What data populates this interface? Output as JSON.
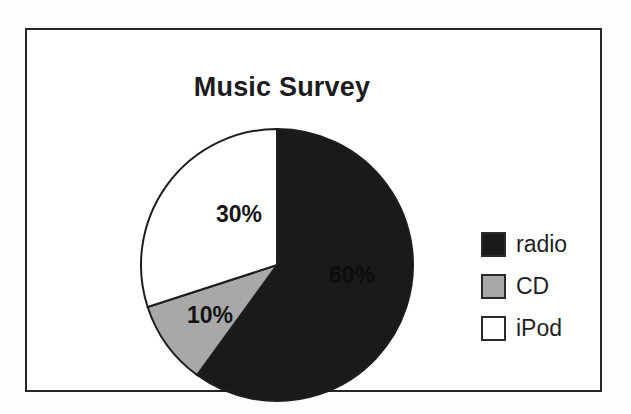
{
  "frame": {
    "border_color": "#262626",
    "background": "#ffffff"
  },
  "chart_data": {
    "type": "pie",
    "title": "Music Survey",
    "xlabel": "",
    "ylabel": "",
    "categories": [
      "radio",
      "CD",
      "iPod"
    ],
    "values": [
      60,
      10,
      30
    ],
    "value_unit": "%",
    "data_labels": [
      "60%",
      "10%",
      "30%"
    ],
    "colors": [
      "#1a1a1a",
      "#a8a8a8",
      "#ffffff"
    ],
    "slice_outline_color": "#1e1e1e",
    "start_angle_deg": 0,
    "direction": "clockwise",
    "legend_position": "right",
    "grid": false,
    "slices": [
      {
        "label": "radio",
        "value": 60,
        "data_label": "60%",
        "color": "#1a1a1a",
        "start_deg": 0,
        "end_deg": 216
      },
      {
        "label": "CD",
        "value": 10,
        "data_label": "10%",
        "color": "#a8a8a8",
        "start_deg": 216,
        "end_deg": 252
      },
      {
        "label": "iPod",
        "value": 30,
        "data_label": "30%",
        "color": "#ffffff",
        "start_deg": 252,
        "end_deg": 360
      }
    ]
  },
  "legend": {
    "items": [
      {
        "label": "radio",
        "color": "#1a1a1a"
      },
      {
        "label": "CD",
        "color": "#a8a8a8"
      },
      {
        "label": "iPod",
        "color": "#ffffff"
      }
    ]
  }
}
